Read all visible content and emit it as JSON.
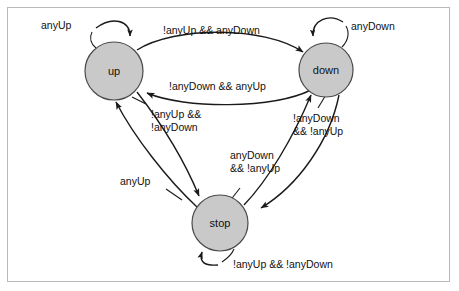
{
  "diagram": {
    "type": "state-machine",
    "background_color": "#ffffff",
    "frame_color": "#b9b9b9",
    "node_fill_color": "#c9c9c9",
    "node_stroke_color": "#4a4a4a",
    "edge_color": "#1a1a1a",
    "text_color": "#111111",
    "states": [
      {
        "id": "up",
        "label": "up",
        "cx": 114,
        "cy": 71,
        "r": 29
      },
      {
        "id": "down",
        "label": "down",
        "cx": 326,
        "cy": 70,
        "r": 27
      },
      {
        "id": "stop",
        "label": "stop",
        "cx": 220,
        "cy": 223,
        "r": 28
      }
    ],
    "transitions": [
      {
        "id": "up-self",
        "from": "up",
        "to": "up",
        "label": "anyUp",
        "label_x": 64,
        "label_y": 29,
        "kind": "self-loop"
      },
      {
        "id": "up-to-down",
        "from": "up",
        "to": "down",
        "label": "!anyUp && anyDown",
        "label_x": 163,
        "label_y": 34,
        "kind": "curve"
      },
      {
        "id": "down-self",
        "from": "down",
        "to": "down",
        "label": "anyDown",
        "label_x": 345,
        "label_y": 30,
        "kind": "self-loop"
      },
      {
        "id": "down-to-up",
        "from": "down",
        "to": "up",
        "label": "!anyDown && anyUp",
        "label_x": 169,
        "label_y": 90,
        "kind": "curve"
      },
      {
        "id": "up-to-stop",
        "from": "up",
        "to": "stop",
        "label_line1": "!anyUp &&",
        "label_line2": "!anyDown",
        "label_x": 151,
        "label_y": 118,
        "kind": "line"
      },
      {
        "id": "stop-to-up",
        "from": "stop",
        "to": "up",
        "label": "anyUp",
        "label_x": 155,
        "label_y": 182,
        "kind": "line"
      },
      {
        "id": "stop-to-down",
        "from": "stop",
        "to": "down",
        "label_line1": "anyDown",
        "label_line2": "&& !anyUp",
        "label_x": 230,
        "label_y": 159,
        "kind": "line"
      },
      {
        "id": "down-to-stop",
        "from": "down",
        "to": "stop",
        "label_line1": "!anyDown",
        "label_line2": "&& !anyUp",
        "label_x": 295,
        "label_y": 122,
        "kind": "line"
      },
      {
        "id": "stop-self",
        "from": "stop",
        "to": "stop",
        "label": "!anyUp && !anyDown",
        "label_x": 233,
        "label_y": 266,
        "kind": "self-loop"
      }
    ]
  }
}
